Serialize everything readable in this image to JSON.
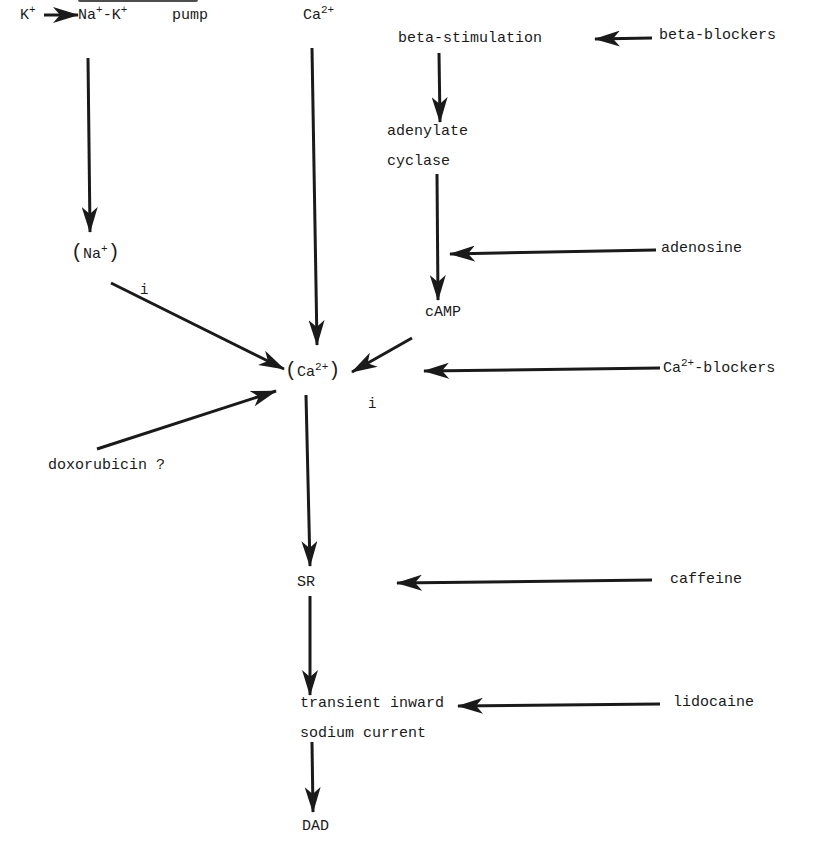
{
  "diagram": {
    "type": "pathway",
    "colors": {
      "ink": "#1a1a1a",
      "background": "#ffffff"
    },
    "nodes": {
      "k_plus": {
        "text": "K",
        "sup": "+"
      },
      "na_k_pump": {
        "na": "Na",
        "na_sup": "+",
        "dash_k": "-K",
        "k_sup": "+",
        "pump": "pump"
      },
      "ca_extracellular": {
        "text": "Ca",
        "sup": "2+"
      },
      "beta_stimulation": {
        "text": "beta-stimulation"
      },
      "beta_blockers": {
        "text": "beta-blockers"
      },
      "adenylate_cyclase": {
        "line1": "adenylate",
        "line2": "cyclase"
      },
      "adenosine": {
        "text": "adenosine"
      },
      "na_intracellular": {
        "open": "(",
        "text": "Na",
        "sup": "+",
        "close": ")",
        "subscript": "i"
      },
      "camp": {
        "text": "cAMP"
      },
      "ca_intracellular": {
        "open": "(",
        "text": "Ca",
        "sup": "2+",
        "close": ")",
        "subscript": "i"
      },
      "ca_blockers": {
        "text": "Ca",
        "sup": "2+",
        "suffix": "-blockers"
      },
      "doxorubicin": {
        "text": "doxorubicin ?"
      },
      "sr": {
        "text": "SR"
      },
      "caffeine": {
        "text": "caffeine"
      },
      "transient_inward": {
        "line1": "transient inward",
        "line2": "sodium current"
      },
      "lidocaine": {
        "text": "lidocaine"
      },
      "dad": {
        "text": "DAD"
      }
    },
    "edges": [
      {
        "from": "K+",
        "to": "Na+-K+ pump"
      },
      {
        "from": "Na+-K+ pump",
        "to": "(Na+)i"
      },
      {
        "from": "Ca2+",
        "to": "(Ca2+)i"
      },
      {
        "from": "beta-blockers",
        "to": "beta-stimulation"
      },
      {
        "from": "beta-stimulation",
        "to": "adenylate cyclase"
      },
      {
        "from": "adenylate cyclase",
        "to": "cAMP"
      },
      {
        "from": "adenosine",
        "to": "adenylate cyclase -> cAMP"
      },
      {
        "from": "(Na+)i",
        "to": "(Ca2+)i"
      },
      {
        "from": "cAMP",
        "to": "(Ca2+)i"
      },
      {
        "from": "Ca2+-blockers",
        "to": "(Ca2+)i"
      },
      {
        "from": "doxorubicin ?",
        "to": "(Ca2+)i"
      },
      {
        "from": "(Ca2+)i",
        "to": "SR"
      },
      {
        "from": "caffeine",
        "to": "SR"
      },
      {
        "from": "SR",
        "to": "transient inward sodium current"
      },
      {
        "from": "lidocaine",
        "to": "transient inward sodium current"
      },
      {
        "from": "transient inward sodium current",
        "to": "DAD"
      }
    ]
  }
}
